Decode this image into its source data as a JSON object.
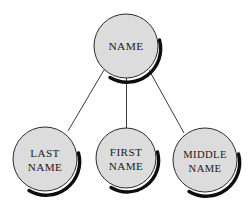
{
  "diagram": {
    "type": "tree",
    "background_color": "#ffffff",
    "node_fill_color": "#dcdcdc",
    "node_stroke_color": "#2b2b2b",
    "shadow_color": "#0d0d0d",
    "edge_color": "#3a3a3a",
    "text_color": "#1a1a1a",
    "nodes": [
      {
        "id": "name",
        "label": "NAME",
        "lines": [
          "NAME"
        ],
        "role": "root",
        "cx": 126,
        "cy": 46,
        "r": 32
      },
      {
        "id": "last-name",
        "label": "LAST NAME",
        "lines": [
          "LAST",
          "NAME"
        ],
        "role": "child",
        "cx": 45,
        "cy": 159,
        "r": 32
      },
      {
        "id": "first-name",
        "label": "FIRST NAME",
        "lines": [
          "FIRST",
          "NAME"
        ],
        "role": "child",
        "cx": 126,
        "cy": 158,
        "r": 30
      },
      {
        "id": "middle-name",
        "label": "MIDDLE NAME",
        "lines": [
          "MIDDLE",
          "NAME"
        ],
        "role": "child",
        "cx": 205,
        "cy": 160,
        "r": 32
      }
    ],
    "edges": [
      {
        "id": "name-to-last-name",
        "from": "name",
        "to": "last-name"
      },
      {
        "id": "name-to-first-name",
        "from": "name",
        "to": "first-name"
      },
      {
        "id": "name-to-middle-name",
        "from": "name",
        "to": "middle-name"
      }
    ]
  }
}
